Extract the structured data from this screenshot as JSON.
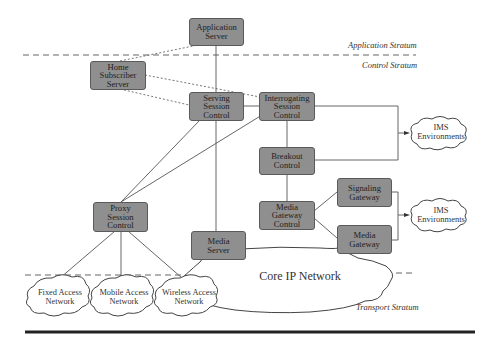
{
  "diagram": {
    "strata": {
      "application": "Application Stratum",
      "control": "Control Stratum",
      "transport": "Transport Stratum"
    },
    "nodes": {
      "application_server": "Application\nServer",
      "home_subscriber_server": "Home\nSubscriber\nServer",
      "serving_session_control": "Serving\nSession\nControl",
      "interrogating_session_control": "Interrogating\nSession\nControl",
      "breakout_control": "Breakout\nControl",
      "signaling_gateway": "Signaling\nGateway",
      "media_gateway_control": "Media\nGateway\nControl",
      "media_gateway": "Media\nGateway",
      "proxy_session_control": "Proxy\nSession\nControl",
      "media_server": "Media\nServer"
    },
    "clouds": {
      "ims_environments_1": "IMS\nEnvironments",
      "ims_environments_2": "IMS\nEnvironments",
      "fixed_access_network": "Fixed Access\nNetwork",
      "mobile_access_network": "Mobile Access\nNetwork",
      "wireless_access_network": "Wireless Access\nNetwork",
      "core_ip_network": "Core IP Network"
    },
    "colors": {
      "box_fill": "#8f8f8f",
      "box_border": "#5a5a5a",
      "line": "#555555"
    }
  }
}
